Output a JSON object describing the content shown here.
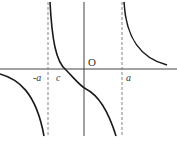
{
  "diagram": {
    "type": "function-graph",
    "labels": {
      "origin": "O",
      "neg_a": "-a",
      "c": "c",
      "a": "a"
    },
    "asymptotes": [
      "-a",
      "a"
    ],
    "colors": {
      "curve": "#1a1a1a",
      "axis": "#444444",
      "asymptote": "#777777"
    }
  }
}
